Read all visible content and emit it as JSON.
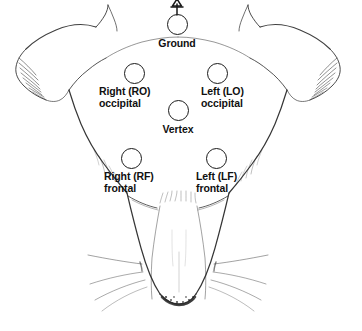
{
  "figure": {
    "background_color": "#ffffff",
    "ink_color": "#1a1a1a",
    "label_color": "#101010",
    "width": 362,
    "height": 331
  },
  "electrodes": [
    {
      "id": "ground",
      "name": "ground-electrode",
      "label_lines": [
        "Ground"
      ],
      "label_line1": "Ground",
      "label_line2": "",
      "circle": {
        "cx": 177,
        "cy": 24,
        "r": 10.5
      },
      "label": {
        "x": 177,
        "y": 38,
        "align": "center"
      },
      "has_ground_symbol": true
    },
    {
      "id": "right_occipital",
      "name": "right-occipital-electrode",
      "label_lines": [
        "Right (RO)",
        "occipital"
      ],
      "label_line1": "Right (RO)",
      "label_line2": "occipital",
      "circle": {
        "cx": 134,
        "cy": 73,
        "r": 10.5
      },
      "label": {
        "x": 99,
        "y": 86,
        "align": "left"
      },
      "has_ground_symbol": false
    },
    {
      "id": "left_occipital",
      "name": "left-occipital-electrode",
      "label_lines": [
        "Left (LO)",
        "occipital"
      ],
      "label_line1": "Left (LO)",
      "label_line2": "occipital",
      "circle": {
        "cx": 217,
        "cy": 73,
        "r": 10.5
      },
      "label": {
        "x": 201,
        "y": 86,
        "align": "left"
      },
      "has_ground_symbol": false
    },
    {
      "id": "vertex",
      "name": "vertex-electrode",
      "label_lines": [
        "Vertex"
      ],
      "label_line1": "Vertex",
      "label_line2": "",
      "circle": {
        "cx": 178,
        "cy": 110,
        "r": 10.5
      },
      "label": {
        "x": 178,
        "y": 124,
        "align": "center"
      },
      "has_ground_symbol": false
    },
    {
      "id": "right_frontal",
      "name": "right-frontal-electrode",
      "label_lines": [
        "Right (RF)",
        "frontal"
      ],
      "label_line1": "Right (RF)",
      "label_line2": "frontal",
      "circle": {
        "cx": 131,
        "cy": 158,
        "r": 10.5
      },
      "label": {
        "x": 104,
        "y": 171,
        "align": "left"
      },
      "has_ground_symbol": false
    },
    {
      "id": "left_frontal",
      "name": "left-frontal-electrode",
      "label_lines": [
        "Left (LF)",
        "frontal"
      ],
      "label_line1": "Left (LF)",
      "label_line2": "frontal",
      "circle": {
        "cx": 216,
        "cy": 158,
        "r": 10.5
      },
      "label": {
        "x": 196,
        "y": 171,
        "align": "left"
      },
      "has_ground_symbol": false
    }
  ],
  "icons": {
    "ground_symbol": "ground-arrow-icon"
  }
}
